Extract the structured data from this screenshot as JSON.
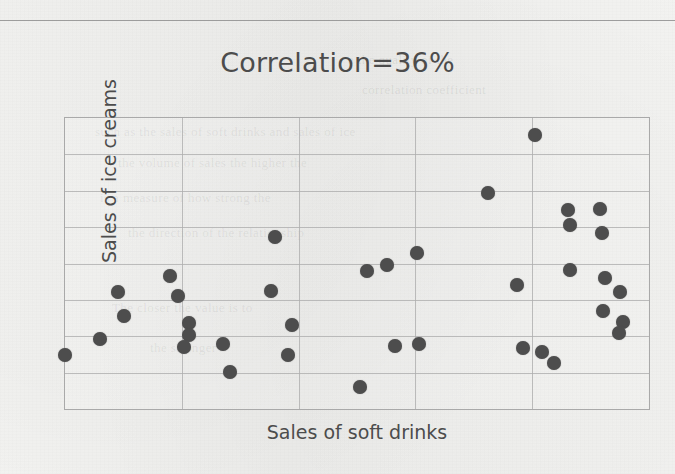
{
  "page": {
    "top_rule": "horizontal-rule",
    "background_color": "#f2f2f0",
    "bleed_text": [
      "a the quality of the",
      "correlation coefficient",
      "such as the sales of soft drinks and sales of ice",
      "the volume of sales the higher the",
      "is a measure of how strong the",
      "the direction of the relationship",
      "The closer the value is to",
      "the stronger"
    ]
  },
  "chart_data": {
    "type": "scatter",
    "title": "Correlation=36%",
    "xlabel": "Sales of soft drinks",
    "ylabel": "Sales of  ice creams",
    "correlation_percent": 36,
    "grid": true,
    "legend": "none",
    "axis_ticks": "none",
    "xlim": [
      0,
      100
    ],
    "ylim": [
      0,
      100
    ],
    "marker": {
      "shape": "circle",
      "color": "#4d4d4d",
      "size_px": 14
    },
    "grid_columns": 5,
    "grid_rows": 8,
    "n_points": 37,
    "points": [
      {
        "x": 0.0,
        "y": 18.4
      },
      {
        "x": 6.0,
        "y": 23.9
      },
      {
        "x": 9.0,
        "y": 40.3
      },
      {
        "x": 10.1,
        "y": 32.1
      },
      {
        "x": 18.0,
        "y": 45.7
      },
      {
        "x": 19.3,
        "y": 38.9
      },
      {
        "x": 21.2,
        "y": 29.4
      },
      {
        "x": 21.2,
        "y": 25.3
      },
      {
        "x": 20.3,
        "y": 21.2
      },
      {
        "x": 27.1,
        "y": 22.5
      },
      {
        "x": 28.2,
        "y": 12.6
      },
      {
        "x": 36.0,
        "y": 59.0
      },
      {
        "x": 35.2,
        "y": 40.6
      },
      {
        "x": 38.9,
        "y": 29.0
      },
      {
        "x": 38.2,
        "y": 18.4
      },
      {
        "x": 50.5,
        "y": 7.5
      },
      {
        "x": 51.7,
        "y": 47.4
      },
      {
        "x": 55.2,
        "y": 49.5
      },
      {
        "x": 60.3,
        "y": 53.6
      },
      {
        "x": 56.5,
        "y": 21.5
      },
      {
        "x": 60.6,
        "y": 22.2
      },
      {
        "x": 72.5,
        "y": 74.1
      },
      {
        "x": 77.4,
        "y": 42.7
      },
      {
        "x": 78.4,
        "y": 20.8
      },
      {
        "x": 80.5,
        "y": 94.2
      },
      {
        "x": 86.2,
        "y": 68.3
      },
      {
        "x": 86.4,
        "y": 63.1
      },
      {
        "x": 86.5,
        "y": 47.8
      },
      {
        "x": 81.7,
        "y": 19.5
      },
      {
        "x": 83.8,
        "y": 15.7
      },
      {
        "x": 91.6,
        "y": 68.6
      },
      {
        "x": 91.9,
        "y": 60.6
      },
      {
        "x": 92.4,
        "y": 44.9
      },
      {
        "x": 95.0,
        "y": 40.3
      },
      {
        "x": 92.2,
        "y": 33.6
      },
      {
        "x": 95.5,
        "y": 30.0
      },
      {
        "x": 94.9,
        "y": 26.2
      }
    ]
  }
}
